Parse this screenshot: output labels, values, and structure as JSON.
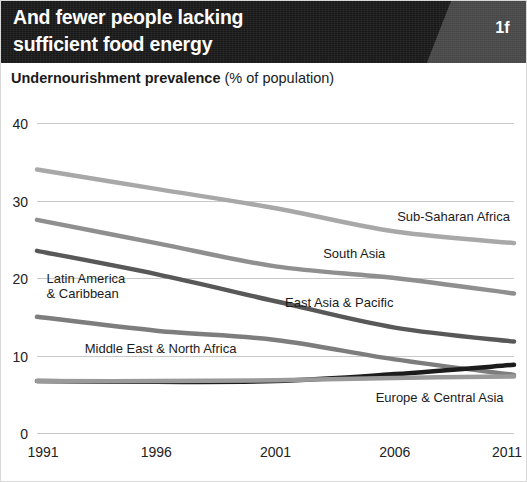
{
  "banner": {
    "title": "And fewer people lacking\nsufficient food energy",
    "badge": "1f",
    "background_color": "#181818",
    "badge_panel_color": "#4a4a4a"
  },
  "subtitle": {
    "bold_part": "Undernourishment prevalence",
    "light_part": " (% of population)"
  },
  "chart_data": {
    "type": "line",
    "title": "Undernourishment prevalence (% of population)",
    "xlabel": "",
    "ylabel": "",
    "x": [
      1991,
      1996,
      2001,
      2006,
      2011
    ],
    "xticklabels": [
      "1991",
      "1996",
      "2001",
      "2006",
      "2011"
    ],
    "yticks": [
      0,
      10,
      20,
      30,
      40
    ],
    "yticklabels": [
      "0",
      "10",
      "20",
      "30",
      "40"
    ],
    "ylim": [
      0,
      40
    ],
    "xlim": [
      1991,
      2011
    ],
    "grid": "horizontal",
    "legend_position": "inline-labels",
    "series": [
      {
        "name": "Sub-Saharan Africa",
        "color": "#a8a8a8",
        "width": 4.5,
        "values": [
          34.0,
          31.5,
          29.0,
          26.0,
          24.5
        ],
        "label_x": 2006.1,
        "label_y": 27.3,
        "label_anchor": "start"
      },
      {
        "name": "South Asia",
        "color": "#8f8f8f",
        "width": 4.5,
        "values": [
          27.5,
          24.5,
          21.5,
          20.0,
          18.0
        ],
        "label_x": 2003.0,
        "label_y": 22.6,
        "label_anchor": "start"
      },
      {
        "name": "East Asia & Pacific",
        "color": "#585858",
        "width": 4.5,
        "values": [
          23.5,
          20.5,
          17.0,
          13.6,
          11.8
        ],
        "label_x": 2001.4,
        "label_y": 16.2,
        "label_anchor": "start"
      },
      {
        "name": "Latin America & Caribbean",
        "color": "#7d7d7d",
        "width": 4.5,
        "values": [
          15.0,
          13.2,
          12.0,
          9.5,
          7.5
        ],
        "label_x": 1991.4,
        "label_y": 19.4,
        "label_anchor": "start",
        "label_lines": [
          "Latin America",
          "& Caribbean"
        ]
      },
      {
        "name": "Middle East & North Africa",
        "color": "#1c1c1c",
        "width": 4.5,
        "values": [
          6.7,
          6.6,
          6.7,
          7.6,
          8.8
        ],
        "label_x": 1993.0,
        "label_y": 10.3,
        "label_anchor": "start"
      },
      {
        "name": "Europe & Central Asia",
        "color": "#9a9a9a",
        "width": 4.5,
        "values": [
          6.7,
          6.7,
          6.8,
          7.1,
          7.3
        ],
        "label_x": 2005.2,
        "label_y": 4.0,
        "label_anchor": "start"
      }
    ]
  }
}
